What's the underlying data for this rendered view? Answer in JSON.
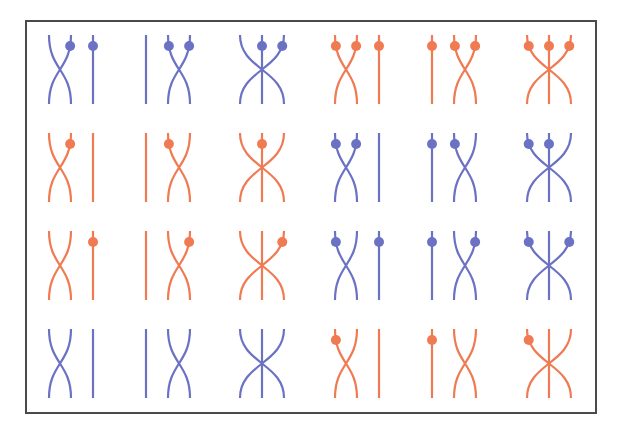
{
  "title": "Braid diagrams on three strands with marked points",
  "colors": {
    "blue": "#6B72C4",
    "orange": "#F07A52",
    "frame": "#4a4a4a",
    "background": "#ffffff"
  },
  "layout": {
    "columns_x": [
      49,
      146,
      240,
      335,
      432,
      527
    ],
    "strand_spacing": 22,
    "rows_y": [
      {
        "top": 35,
        "bottom": 104
      },
      {
        "top": 133,
        "bottom": 202
      },
      {
        "top": 231,
        "bottom": 300
      },
      {
        "top": 329,
        "bottom": 398
      }
    ],
    "dot_offset": 11,
    "dot_radius": 5
  },
  "crossing_types": {
    "sigma1": "strands 1 and 2 cross, strand 3 straight",
    "sigma2": "strand 1 straight, strands 2 and 3 cross",
    "full": "strands 1 and 3 cross over straight middle strand 2"
  },
  "cells": [
    [
      {
        "color": "blue",
        "type": "sigma1",
        "dots": [
          2,
          3
        ]
      },
      {
        "color": "blue",
        "type": "sigma2",
        "dots": [
          2,
          3
        ]
      },
      {
        "color": "blue",
        "type": "full",
        "dots": [
          2,
          3
        ]
      },
      {
        "color": "orange",
        "type": "sigma1",
        "dots": [
          1,
          2,
          3
        ]
      },
      {
        "color": "orange",
        "type": "sigma2",
        "dots": [
          1,
          2,
          3
        ]
      },
      {
        "color": "orange",
        "type": "full",
        "dots": [
          1,
          2,
          3
        ]
      }
    ],
    [
      {
        "color": "orange",
        "type": "sigma1",
        "dots": [
          2
        ]
      },
      {
        "color": "orange",
        "type": "sigma2",
        "dots": [
          2
        ]
      },
      {
        "color": "orange",
        "type": "full",
        "dots": [
          2
        ]
      },
      {
        "color": "blue",
        "type": "sigma1",
        "dots": [
          1,
          2
        ]
      },
      {
        "color": "blue",
        "type": "sigma2",
        "dots": [
          1,
          2
        ]
      },
      {
        "color": "blue",
        "type": "full",
        "dots": [
          1,
          2
        ]
      }
    ],
    [
      {
        "color": "orange",
        "type": "sigma1",
        "dots": [
          3
        ]
      },
      {
        "color": "orange",
        "type": "sigma2",
        "dots": [
          3
        ]
      },
      {
        "color": "orange",
        "type": "full",
        "dots": [
          3
        ]
      },
      {
        "color": "blue",
        "type": "sigma1",
        "dots": [
          1,
          3
        ]
      },
      {
        "color": "blue",
        "type": "sigma2",
        "dots": [
          1,
          3
        ]
      },
      {
        "color": "blue",
        "type": "full",
        "dots": [
          1,
          3
        ]
      }
    ],
    [
      {
        "color": "blue",
        "type": "sigma1",
        "dots": []
      },
      {
        "color": "blue",
        "type": "sigma2",
        "dots": []
      },
      {
        "color": "blue",
        "type": "full",
        "dots": []
      },
      {
        "color": "orange",
        "type": "sigma1",
        "dots": [
          1
        ]
      },
      {
        "color": "orange",
        "type": "sigma2",
        "dots": [
          1
        ]
      },
      {
        "color": "orange",
        "type": "full",
        "dots": [
          1
        ]
      }
    ]
  ]
}
